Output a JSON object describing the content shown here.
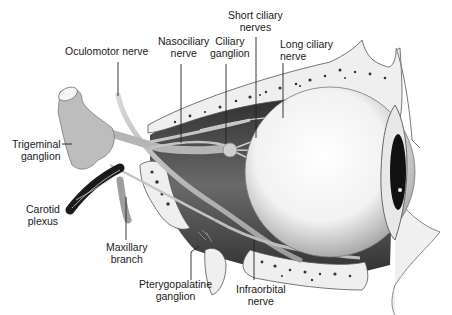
{
  "diagram": {
    "labels": [
      {
        "id": "oculomotor",
        "lines": [
          "Oculomotor nerve"
        ]
      },
      {
        "id": "nasociliary",
        "lines": [
          "Nasociliary",
          "nerve"
        ]
      },
      {
        "id": "ciliary-ganglion",
        "lines": [
          "Ciliary",
          "ganglion"
        ]
      },
      {
        "id": "short-ciliary",
        "lines": [
          "Short ciliary",
          "nerves"
        ]
      },
      {
        "id": "long-ciliary",
        "lines": [
          "Long ciliary",
          "nerve"
        ]
      },
      {
        "id": "trigeminal",
        "lines": [
          "Trigeminal",
          "ganglion"
        ]
      },
      {
        "id": "carotid",
        "lines": [
          "Carotid",
          "plexus"
        ]
      },
      {
        "id": "maxillary",
        "lines": [
          "Maxillary",
          "branch"
        ]
      },
      {
        "id": "pterygopalatine",
        "lines": [
          "Pterygopalatine",
          "ganglion"
        ]
      },
      {
        "id": "infraorbital",
        "lines": [
          "Infraorbital",
          "nerve"
        ]
      }
    ],
    "colors": {
      "background": "#ffffff",
      "text": "#1a1a1a",
      "leader": "#222222",
      "bone": "#eeeeee",
      "bone_spots": "#333333",
      "nerve": "#b8b8b8",
      "dark_orbit": "#3a3a3a",
      "globe": "#f6f6f6"
    }
  }
}
